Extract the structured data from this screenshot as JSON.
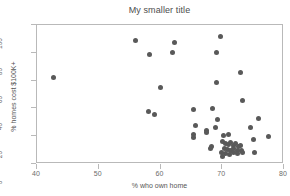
{
  "chart_data": {
    "type": "scatter",
    "title": "My smaller title",
    "xlabel": "% who own home",
    "ylabel": "% homes cost $100K+",
    "xlim": [
      40,
      80
    ],
    "ylim": [
      0,
      100
    ],
    "xticks": [
      40,
      50,
      60,
      70,
      80
    ],
    "yticks": [
      0,
      20,
      40,
      60,
      80,
      100
    ],
    "grid": false,
    "legend": null,
    "marker_color": "#595959",
    "series": [
      {
        "name": "states",
        "points": [
          [
            42.6,
            62.0
          ],
          [
            55.9,
            89.0
          ],
          [
            58.2,
            79.0
          ],
          [
            62.2,
            87.5
          ],
          [
            62.0,
            80.0
          ],
          [
            69.7,
            92.0
          ],
          [
            69.0,
            80.0
          ],
          [
            60.0,
            55.0
          ],
          [
            69.0,
            58.5
          ],
          [
            72.9,
            66.0
          ],
          [
            73.2,
            45.5
          ],
          [
            58.1,
            37.5
          ],
          [
            59.0,
            35.5
          ],
          [
            65.3,
            39.5
          ],
          [
            68.4,
            40.0
          ],
          [
            75.8,
            33.0
          ],
          [
            69.3,
            32.0
          ],
          [
            65.6,
            28.0
          ],
          [
            68.9,
            26.5
          ],
          [
            74.5,
            26.5
          ],
          [
            67.5,
            24.0
          ],
          [
            67.4,
            22.5
          ],
          [
            65.4,
            21.0
          ],
          [
            65.4,
            19.0
          ],
          [
            70.2,
            20.5
          ],
          [
            71.0,
            21.0
          ],
          [
            77.5,
            20.0
          ],
          [
            75.0,
            17.5
          ],
          [
            68.2,
            12.5
          ],
          [
            68.1,
            11.0
          ],
          [
            70.0,
            16.0
          ],
          [
            70.5,
            15.0
          ],
          [
            71.0,
            14.0
          ],
          [
            71.4,
            15.5
          ],
          [
            71.8,
            13.5
          ],
          [
            72.2,
            14.5
          ],
          [
            72.6,
            12.5
          ],
          [
            73.0,
            13.0
          ],
          [
            70.3,
            11.5
          ],
          [
            70.8,
            10.5
          ],
          [
            71.3,
            10.0
          ],
          [
            71.9,
            11.0
          ],
          [
            72.4,
            9.5
          ],
          [
            73.1,
            10.0
          ],
          [
            69.9,
            8.0
          ],
          [
            70.6,
            7.5
          ],
          [
            71.2,
            7.0
          ],
          [
            71.8,
            8.5
          ],
          [
            72.5,
            7.5
          ],
          [
            73.3,
            8.0
          ],
          [
            70.1,
            5.5
          ],
          [
            75.2,
            8.5
          ]
        ]
      }
    ]
  }
}
